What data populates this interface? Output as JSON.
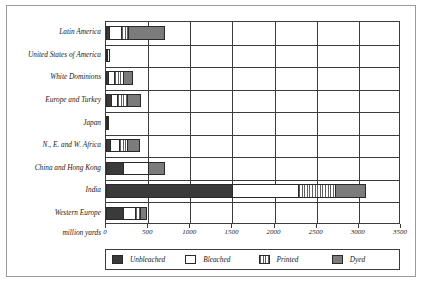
{
  "chart_data": {
    "type": "bar",
    "orientation": "horizontal",
    "stacked": true,
    "title": "",
    "xlabel": "million yards",
    "ylabel": "",
    "xlim": [
      0,
      3500
    ],
    "xticks": [
      0,
      500,
      1000,
      1500,
      2000,
      2500,
      3000,
      3500
    ],
    "xticklabels": [
      "0",
      "500",
      "1000",
      "1500",
      "2000",
      "2500",
      "3000",
      "3500"
    ],
    "grid": true,
    "legend_position": "bottom",
    "categories": [
      "Latin America",
      "United States of America",
      "White Dominions",
      "Europe and Turkey",
      "Japan",
      "N., E. and W. Africa",
      "China and Hong Kong",
      "India",
      "Western Europe"
    ],
    "series": [
      {
        "name": "Unbleached",
        "color": "#3a3a3a",
        "pattern": "solid-dark",
        "values": [
          30,
          15,
          25,
          60,
          20,
          45,
          200,
          1490,
          200
        ]
      },
      {
        "name": "Bleached",
        "color": "#ffffff",
        "pattern": "solid-white",
        "values": [
          150,
          35,
          65,
          70,
          20,
          115,
          300,
          790,
          150
        ]
      },
      {
        "name": "Printed",
        "color": "#5f5f5f",
        "pattern": "vertical-stripes",
        "values": [
          80,
          0,
          110,
          120,
          0,
          90,
          0,
          440,
          55
        ]
      },
      {
        "name": "Dyed",
        "color": "#7b7b7b",
        "pattern": "solid-gray",
        "values": [
          440,
          0,
          120,
          160,
          0,
          150,
          200,
          370,
          85
        ]
      }
    ],
    "totals": [
      700,
      50,
      320,
      410,
      40,
      400,
      700,
      3090,
      490
    ]
  },
  "legend": {
    "entries": [
      {
        "label": "Unbleached"
      },
      {
        "label": "Bleached"
      },
      {
        "label": "Printed"
      },
      {
        "label": "Dyed"
      }
    ]
  }
}
